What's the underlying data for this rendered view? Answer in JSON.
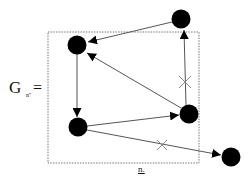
{
  "label": {
    "graph_symbol": "G",
    "subscript": "n''",
    "equals": "=",
    "bottom_caption": "n."
  },
  "colors": {
    "node": "#000000",
    "edge": "#555555",
    "box": "#777777",
    "background": "#ffffff"
  },
  "nodes": [
    {
      "id": "A",
      "position": "top-left inside box"
    },
    {
      "id": "B",
      "position": "top-right above box"
    },
    {
      "id": "C",
      "position": "bottom-left inside box"
    },
    {
      "id": "D",
      "position": "middle-right on box edge"
    },
    {
      "id": "E",
      "position": "bottom-right outside box"
    }
  ],
  "edges": [
    {
      "from": "B",
      "to": "A",
      "crossed": false
    },
    {
      "from": "D",
      "to": "A",
      "crossed": false
    },
    {
      "from": "A",
      "to": "C",
      "crossed": false
    },
    {
      "from": "C",
      "to": "D",
      "crossed": false
    },
    {
      "from": "D",
      "to": "B",
      "crossed": true
    },
    {
      "from": "C",
      "to": "E",
      "crossed": true
    }
  ]
}
